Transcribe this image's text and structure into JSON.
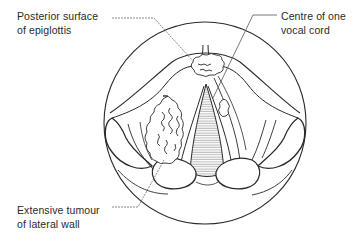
{
  "diagram": {
    "labels": {
      "epiglottis": {
        "line1": "Posterior surface",
        "line2": "of epiglottis"
      },
      "vocal_cord": {
        "line1": "Centre of one",
        "line2": "vocal cord"
      },
      "tumour": {
        "line1": "Extensive tumour",
        "line2": "of lateral wall"
      }
    },
    "colors": {
      "line": "#2a2a2a",
      "leader": "#555555",
      "background": "#ffffff",
      "shading": "#9a9a9a"
    }
  }
}
